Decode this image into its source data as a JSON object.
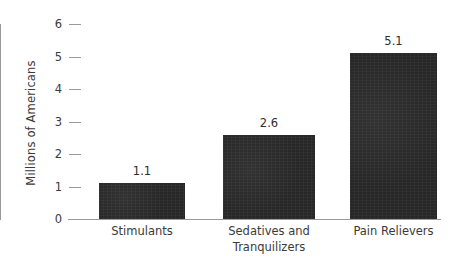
{
  "chart_data": {
    "type": "bar",
    "title": "",
    "subtitle": "",
    "xlabel": "",
    "ylabel": "Millions of Americans",
    "categories": [
      "Stimulants",
      "Sedatives and Tranquilizers",
      "Pain Relievers"
    ],
    "category_lines": [
      [
        "Stimulants"
      ],
      [
        "Sedatives and",
        "Tranquilizers"
      ],
      [
        "Pain Relievers"
      ]
    ],
    "values": [
      1.1,
      2.6,
      5.1
    ],
    "value_labels": [
      "1.1",
      "2.6",
      "5.1"
    ],
    "ylim": [
      0,
      6
    ],
    "y_ticks": [
      0,
      1,
      2,
      3,
      4,
      5,
      6
    ],
    "y_tick_labels": [
      "0",
      "1",
      "2",
      "3",
      "4",
      "5",
      "6"
    ],
    "grid": false,
    "legend": null,
    "legend_position": "none",
    "bar_color": "#272727",
    "axis_color": "#9a9a9a",
    "text_color": "#3a3a3a",
    "background_color": "#ffffff"
  }
}
